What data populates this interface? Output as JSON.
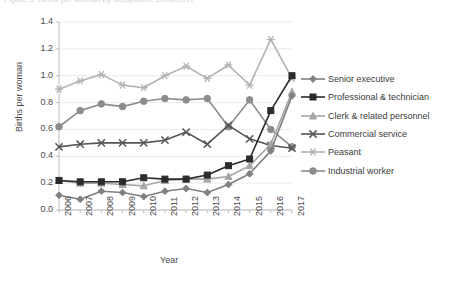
{
  "cut_title_text": "Figure 3. Births per woman by occupation, 2006-2017",
  "axis": {
    "ylabel": "Births per woman",
    "xlabel": "Year",
    "yticks": [
      "0.0",
      "0.2",
      "0.4",
      "0.6",
      "0.8",
      "1.0",
      "1.2",
      "1.4"
    ],
    "ylim": [
      0.0,
      1.4
    ]
  },
  "legend": {
    "position": "right",
    "items": [
      {
        "label": "Senior executive",
        "marker": "diamond",
        "color": "#808080"
      },
      {
        "label": "Professional & technician",
        "marker": "square",
        "color": "#2b2b2b"
      },
      {
        "label": "Clerk & related personnel",
        "marker": "triangle",
        "color": "#a6a6a6"
      },
      {
        "label": "Commercial service",
        "marker": "x",
        "color": "#555555"
      },
      {
        "label": "Peasant",
        "marker": "asterisk",
        "color": "#b3b3b3"
      },
      {
        "label": "Industrial worker",
        "marker": "circle",
        "color": "#8c8c8c"
      }
    ]
  },
  "chart_data": {
    "type": "line",
    "title": "",
    "xlabel": "Year",
    "ylabel": "Births per woman",
    "ylim": [
      0.0,
      1.4
    ],
    "grid": true,
    "legend_position": "right",
    "categories": [
      "2006",
      "2007",
      "2008",
      "2009",
      "2010",
      "2011",
      "2012",
      "2013",
      "2014",
      "2015",
      "2016",
      "2017"
    ],
    "series": [
      {
        "name": "Senior executive",
        "marker": "diamond",
        "color": "#808080",
        "values": [
          0.11,
          0.08,
          0.14,
          0.13,
          0.1,
          0.14,
          0.16,
          0.13,
          0.19,
          0.27,
          0.44,
          0.85
        ]
      },
      {
        "name": "Professional & technician",
        "marker": "square",
        "color": "#2b2b2b",
        "values": [
          0.22,
          0.21,
          0.21,
          0.21,
          0.24,
          0.23,
          0.23,
          0.26,
          0.33,
          0.38,
          0.74,
          1.0
        ]
      },
      {
        "name": "Clerk & related personnel",
        "marker": "triangle",
        "color": "#a6a6a6",
        "values": [
          0.22,
          0.2,
          0.2,
          0.19,
          0.18,
          0.22,
          0.23,
          0.23,
          0.25,
          0.33,
          0.49,
          0.88
        ]
      },
      {
        "name": "Commercial service",
        "marker": "x",
        "color": "#555555",
        "values": [
          0.47,
          0.49,
          0.5,
          0.5,
          0.5,
          0.52,
          0.58,
          0.49,
          0.63,
          0.53,
          0.48,
          0.46
        ]
      },
      {
        "name": "Peasant",
        "marker": "asterisk",
        "color": "#b3b3b3",
        "values": [
          0.9,
          0.96,
          1.01,
          0.93,
          0.91,
          1.0,
          1.07,
          0.98,
          1.08,
          0.93,
          1.27,
          0.98
        ]
      },
      {
        "name": "Industrial worker",
        "marker": "circle",
        "color": "#8c8c8c",
        "values": [
          0.62,
          0.74,
          0.79,
          0.77,
          0.81,
          0.83,
          0.82,
          0.83,
          0.62,
          0.82,
          0.6,
          0.47
        ]
      }
    ]
  }
}
